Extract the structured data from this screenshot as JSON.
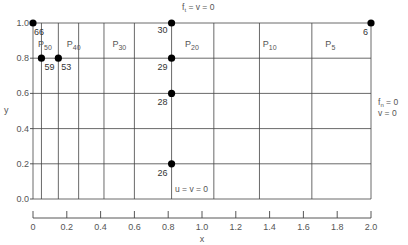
{
  "chart_data": {
    "type": "scatter",
    "title": "",
    "xlabel": "x",
    "ylabel": "y",
    "xlim": [
      0,
      2.0
    ],
    "ylim": [
      0,
      1.0
    ],
    "grid": true,
    "x_ticks": [
      0,
      0.2,
      0.4,
      0.6,
      0.8,
      1.0,
      1.2,
      1.4,
      1.6,
      1.8,
      2.0
    ],
    "x_tick_labels": [
      "0",
      "0.2",
      "0.4",
      "0.6",
      "0.8",
      "1.0",
      "1.2",
      "1.4",
      "1.6",
      "1.8",
      "2.0"
    ],
    "y_ticks": [
      0.0,
      0.2,
      0.4,
      0.6,
      0.8,
      1.0
    ],
    "y_tick_labels": [
      "0.0",
      "0.2",
      "0.4",
      "0.6",
      "0.8",
      "1.0"
    ],
    "mesh_x_lines": [
      0,
      0.05,
      0.15,
      0.27,
      0.42,
      0.6,
      0.82,
      1.07,
      1.34,
      1.65,
      2.0
    ],
    "mesh_y_lines": [
      0,
      0.2,
      0.4,
      0.6,
      0.8,
      1.0
    ],
    "points": [
      {
        "label": "66",
        "x": 0.0,
        "y": 1.0
      },
      {
        "label": "59",
        "x": 0.05,
        "y": 0.8
      },
      {
        "label": "53",
        "x": 0.15,
        "y": 0.8
      },
      {
        "label": "30",
        "x": 0.82,
        "y": 1.0
      },
      {
        "label": "29",
        "x": 0.82,
        "y": 0.8
      },
      {
        "label": "28",
        "x": 0.82,
        "y": 0.6
      },
      {
        "label": "26",
        "x": 0.82,
        "y": 0.2
      },
      {
        "label": "6",
        "x": 2.0,
        "y": 1.0
      }
    ],
    "regions": [
      {
        "label": "P",
        "sub": "50",
        "x": 0.03,
        "y": 0.88
      },
      {
        "label": "P",
        "sub": "40",
        "x": 0.2,
        "y": 0.88
      },
      {
        "label": "P",
        "sub": "30",
        "x": 0.47,
        "y": 0.88
      },
      {
        "label": "P",
        "sub": "20",
        "x": 0.9,
        "y": 0.88
      },
      {
        "label": "P",
        "sub": "10",
        "x": 1.36,
        "y": 0.88
      },
      {
        "label": "P",
        "sub": "5",
        "x": 1.73,
        "y": 0.88
      }
    ],
    "annotations": {
      "top": {
        "main": "f",
        "sub": "t",
        "rest": " = v = 0"
      },
      "right_line1": {
        "main": "f",
        "sub": "n",
        "rest": " = 0"
      },
      "right_line2": "v = 0",
      "bottom": "u = v = 0"
    }
  }
}
